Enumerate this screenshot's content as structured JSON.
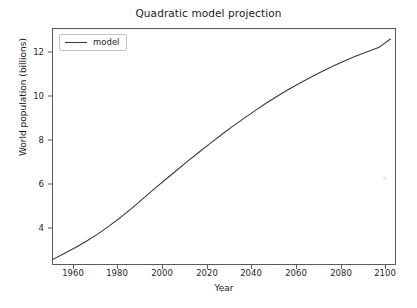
{
  "chart_data": {
    "type": "line",
    "title": "Quadratic model projection",
    "xlabel": "Year",
    "ylabel": "World population (billions)",
    "xlim": [
      1950,
      2102
    ],
    "ylim": [
      2.35,
      12.95
    ],
    "xticks": [
      1960,
      1980,
      2000,
      2020,
      2040,
      2060,
      2080,
      2100
    ],
    "xticklabels": [
      "1960",
      "1980",
      "2000",
      "2020",
      "2040",
      "2060",
      "2080",
      "2100"
    ],
    "yticks": [
      4,
      6,
      8,
      10,
      12
    ],
    "yticklabels": [
      "4",
      "6",
      "8",
      "10",
      "12"
    ],
    "grid": false,
    "legend": {
      "position": "upper left",
      "entries": [
        {
          "label": "model",
          "color": "#36393f",
          "style": "solid"
        }
      ]
    },
    "series": [
      {
        "name": "model",
        "color": "#36393f",
        "linewidth": 1.1,
        "x": [
          1950,
          1955,
          1960,
          1965,
          1970,
          1975,
          1980,
          1985,
          1990,
          1995,
          2000,
          2005,
          2010,
          2015,
          2020,
          2025,
          2030,
          2035,
          2040,
          2045,
          2050,
          2055,
          2060,
          2065,
          2070,
          2075,
          2080,
          2085,
          2090,
          2095,
          2100
        ],
        "y": [
          2.56,
          2.82,
          3.09,
          3.39,
          3.71,
          4.07,
          4.45,
          4.86,
          5.3,
          5.74,
          6.16,
          6.58,
          7.0,
          7.4,
          7.8,
          8.19,
          8.57,
          8.93,
          9.28,
          9.62,
          9.94,
          10.24,
          10.53,
          10.8,
          11.06,
          11.3,
          11.53,
          11.74,
          11.94,
          12.13,
          12.5
        ]
      }
    ]
  },
  "figure": {
    "background": "#ffffff",
    "axes_edge_color": "#5a5a5a",
    "text_color": "#1f1f1f"
  }
}
